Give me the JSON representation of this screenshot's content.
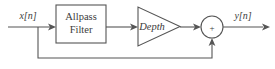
{
  "diagram": {
    "colors": {
      "background": "#ffffff",
      "line": "#555555",
      "text": "#3b3b3b"
    },
    "input_label": "x[n]",
    "output_label": "y[n]",
    "block": {
      "line1": "Allpass",
      "line2": "Filter"
    },
    "gain": {
      "label": "Depth"
    },
    "summer": {
      "sign": "+"
    }
  }
}
